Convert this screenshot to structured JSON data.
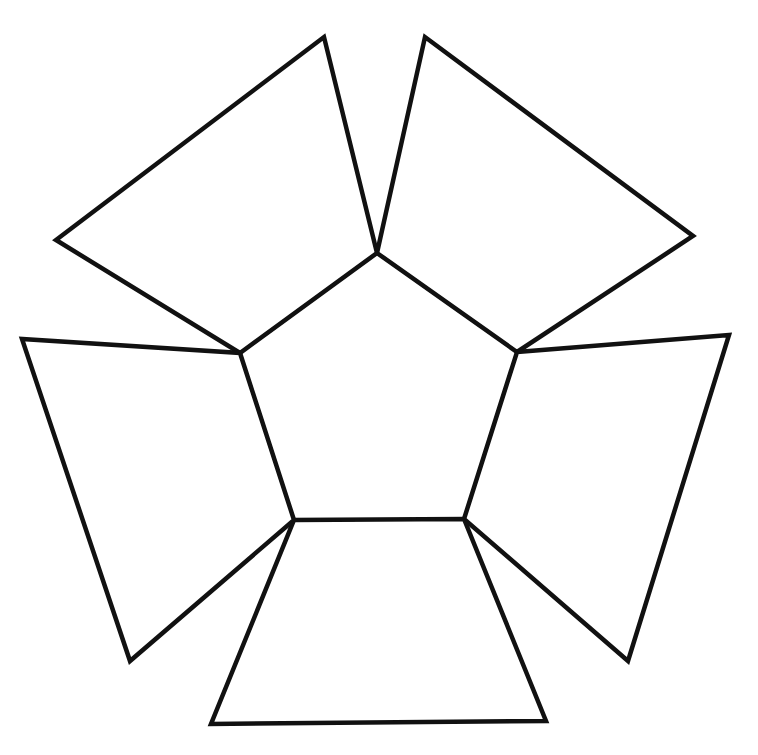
{
  "diagram": {
    "type": "polyhedron-net",
    "colors": {
      "background": "#ffffff",
      "stroke": "#111111"
    },
    "top_clipped_text": "",
    "center_pentagon": {
      "style": "dashed",
      "vertices": [
        [
          377,
          253
        ],
        [
          517,
          352
        ],
        [
          464,
          519
        ],
        [
          294,
          520
        ],
        [
          240,
          353
        ]
      ]
    },
    "flaps": [
      {
        "name": "top-left",
        "points": [
          [
            377,
            253
          ],
          [
            324,
            37
          ],
          [
            56,
            240
          ],
          [
            240,
            353
          ]
        ]
      },
      {
        "name": "top-right",
        "points": [
          [
            377,
            253
          ],
          [
            425,
            37
          ],
          [
            693,
            236
          ],
          [
            517,
            352
          ]
        ]
      },
      {
        "name": "right",
        "points": [
          [
            517,
            352
          ],
          [
            729,
            335
          ],
          [
            628,
            661
          ],
          [
            464,
            519
          ]
        ]
      },
      {
        "name": "bottom",
        "points": [
          [
            464,
            519
          ],
          [
            546,
            721
          ],
          [
            211,
            724
          ],
          [
            294,
            520
          ]
        ]
      },
      {
        "name": "left",
        "points": [
          [
            294,
            520
          ],
          [
            130,
            661
          ],
          [
            22,
            339
          ],
          [
            240,
            353
          ]
        ]
      }
    ]
  }
}
